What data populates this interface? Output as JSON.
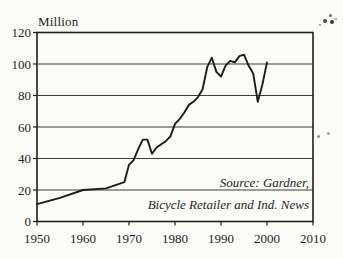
{
  "page": {
    "background": "#fbfbf8",
    "ink": "#1f1f1f"
  },
  "chart_data": {
    "type": "line",
    "title": "",
    "ylabel": "Million",
    "xlabel": "",
    "xlim": [
      1950,
      2010
    ],
    "ylim": [
      0,
      120
    ],
    "xticks": [
      1950,
      1960,
      1970,
      1980,
      1990,
      2000,
      2010
    ],
    "yticks": [
      0,
      20,
      40,
      60,
      80,
      100,
      120
    ],
    "grid": "horizontal-only",
    "legend": "none",
    "line_color": "#1c1c1c",
    "x": [
      1950,
      1955,
      1960,
      1965,
      1969,
      1970,
      1971,
      1972,
      1973,
      1974,
      1975,
      1976,
      1977,
      1978,
      1979,
      1980,
      1981,
      1982,
      1983,
      1984,
      1985,
      1986,
      1987,
      1988,
      1989,
      1990,
      1991,
      1992,
      1993,
      1994,
      1995,
      1996,
      1997,
      1998,
      1999,
      2000
    ],
    "values": [
      11,
      15,
      20,
      21,
      25,
      36,
      39,
      46,
      52,
      52,
      43,
      47,
      49,
      51,
      54,
      62,
      65,
      69,
      74,
      76,
      79,
      84,
      98,
      104,
      95,
      92,
      99,
      102,
      101,
      105,
      106,
      99,
      94,
      76,
      87,
      101
    ],
    "annotations": [
      "Source: Gardner,",
      "Bicycle Retailer and Ind. News"
    ]
  }
}
